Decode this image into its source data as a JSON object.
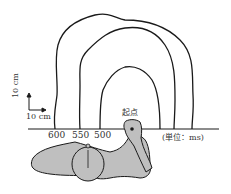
{
  "figure": {
    "scale_bar": {
      "vertical_label": "10 cm",
      "horizontal_label": "10 cm"
    },
    "start_label": "起点",
    "unit_label": "(単位：ms)",
    "contours": [
      {
        "label": "600",
        "value_ms": 600
      },
      {
        "label": "550",
        "value_ms": 550
      },
      {
        "label": "500",
        "value_ms": 500
      }
    ],
    "colors": {
      "line": "#1a1a1a",
      "body_fill": "#bfbfbf"
    }
  }
}
